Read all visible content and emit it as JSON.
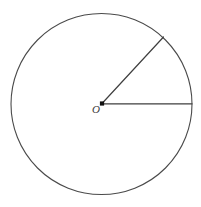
{
  "figure": {
    "kind": "geometry-diagram",
    "background_color": "#ffffff",
    "stroke_color": "#4a4a4a",
    "radius_stroke_color": "#3f3f3f",
    "point_color": "#111111",
    "canvas": {
      "width": 201,
      "height": 207
    },
    "circle": {
      "name": "main-circle",
      "center_x": 101.5,
      "center_y": 104.0,
      "radius": 90.5,
      "stroke_width": 1.1,
      "fill": "none"
    },
    "center_point": {
      "name": "center-point-O",
      "x": 102.0,
      "y": 103.5,
      "size": 4.2,
      "shape": "square-dot"
    },
    "center_label": {
      "text": "O",
      "x": 92,
      "y": 104,
      "font_size": 11,
      "style": "italic"
    },
    "radii": [
      {
        "name": "radius-horizontal",
        "from_x": 102.0,
        "from_y": 103.8,
        "to_x": 192.0,
        "to_y": 103.8,
        "stroke_width": 1.2,
        "angle_degrees": 0
      },
      {
        "name": "radius-upper-right",
        "from_x": 102.0,
        "from_y": 103.5,
        "to_x": 163.5,
        "to_y": 37.0,
        "stroke_width": 1.2,
        "angle_degrees": 47
      }
    ]
  }
}
